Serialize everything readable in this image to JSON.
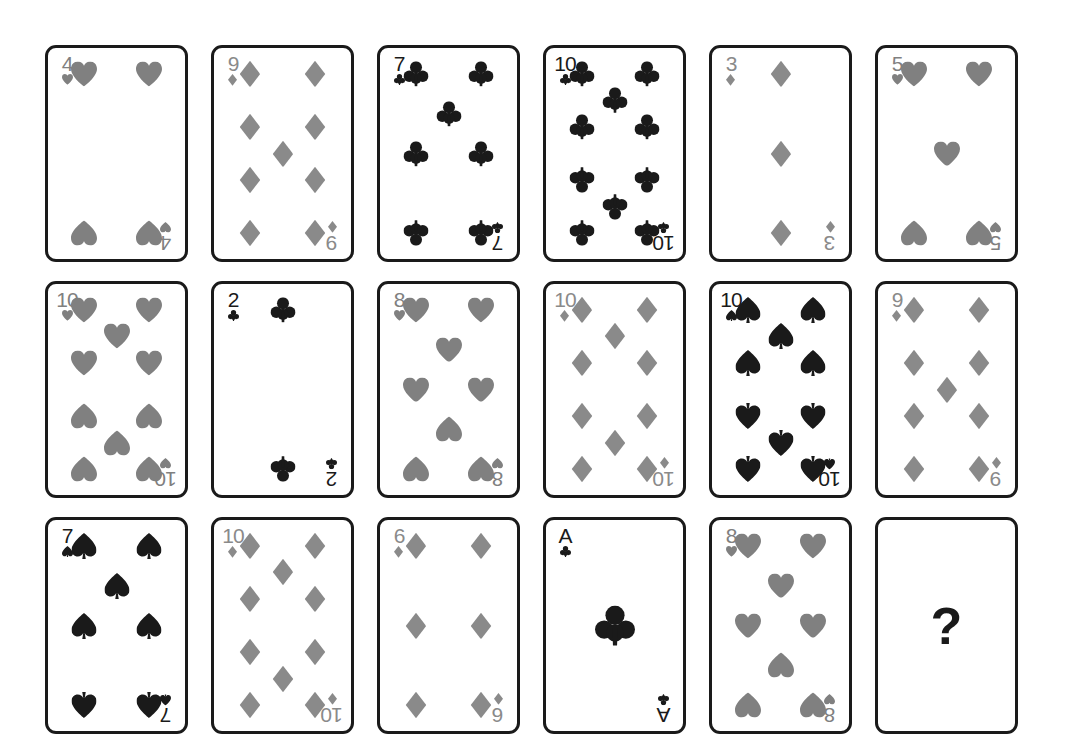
{
  "page": {
    "background_color": "#ffffff",
    "rows": 3,
    "columns": 6
  },
  "colors": {
    "hearts": "#808080",
    "diamonds": "#8a8a8a",
    "clubs": "#1a1a1a",
    "spades": "#1a1a1a",
    "card_border": "#1a1a1a",
    "card_face": "#ffffff",
    "unknown_mark": "#1a1a1a"
  },
  "suit_glyphs": {
    "hearts": "heart-pip",
    "diamonds": "diamond-pip",
    "clubs": "club-pip",
    "spades": "spade-pip"
  },
  "cards": [
    {
      "position": 1,
      "row": 1,
      "col": 1,
      "rank": "4",
      "suit": "hearts",
      "value": 4,
      "face_up": true,
      "label": "4 of Hearts"
    },
    {
      "position": 2,
      "row": 1,
      "col": 2,
      "rank": "9",
      "suit": "diamonds",
      "value": 9,
      "face_up": true,
      "label": "9 of Diamonds"
    },
    {
      "position": 3,
      "row": 1,
      "col": 3,
      "rank": "7",
      "suit": "clubs",
      "value": 7,
      "face_up": true,
      "label": "7 of Clubs"
    },
    {
      "position": 4,
      "row": 1,
      "col": 4,
      "rank": "10",
      "suit": "clubs",
      "value": 10,
      "face_up": true,
      "label": "10 of Clubs"
    },
    {
      "position": 5,
      "row": 1,
      "col": 5,
      "rank": "3",
      "suit": "diamonds",
      "value": 3,
      "face_up": true,
      "label": "3 of Diamonds"
    },
    {
      "position": 6,
      "row": 1,
      "col": 6,
      "rank": "5",
      "suit": "hearts",
      "value": 5,
      "face_up": true,
      "label": "5 of Hearts"
    },
    {
      "position": 7,
      "row": 2,
      "col": 1,
      "rank": "10",
      "suit": "hearts",
      "value": 10,
      "face_up": true,
      "label": "10 of Hearts"
    },
    {
      "position": 8,
      "row": 2,
      "col": 2,
      "rank": "2",
      "suit": "clubs",
      "value": 2,
      "face_up": true,
      "label": "2 of Clubs"
    },
    {
      "position": 9,
      "row": 2,
      "col": 3,
      "rank": "8",
      "suit": "hearts",
      "value": 8,
      "face_up": true,
      "label": "8 of Hearts"
    },
    {
      "position": 10,
      "row": 2,
      "col": 4,
      "rank": "10",
      "suit": "diamonds",
      "value": 10,
      "face_up": true,
      "label": "10 of Diamonds"
    },
    {
      "position": 11,
      "row": 2,
      "col": 5,
      "rank": "10",
      "suit": "spades",
      "value": 10,
      "face_up": true,
      "label": "10 of Spades"
    },
    {
      "position": 12,
      "row": 2,
      "col": 6,
      "rank": "9",
      "suit": "diamonds",
      "value": 9,
      "face_up": true,
      "label": "9 of Diamonds"
    },
    {
      "position": 13,
      "row": 3,
      "col": 1,
      "rank": "7",
      "suit": "spades",
      "value": 7,
      "face_up": true,
      "label": "7 of Spades"
    },
    {
      "position": 14,
      "row": 3,
      "col": 2,
      "rank": "10",
      "suit": "diamonds",
      "value": 10,
      "face_up": true,
      "label": "10 of Diamonds"
    },
    {
      "position": 15,
      "row": 3,
      "col": 3,
      "rank": "6",
      "suit": "diamonds",
      "value": 6,
      "face_up": true,
      "label": "6 of Diamonds"
    },
    {
      "position": 16,
      "row": 3,
      "col": 4,
      "rank": "A",
      "suit": "clubs",
      "value": 1,
      "face_up": true,
      "label": "Ace of Clubs"
    },
    {
      "position": 17,
      "row": 3,
      "col": 5,
      "rank": "8",
      "suit": "hearts",
      "value": 8,
      "face_up": true,
      "label": "8 of Hearts"
    },
    {
      "position": 18,
      "row": 3,
      "col": 6,
      "rank": "?",
      "suit": null,
      "value": null,
      "face_up": false,
      "label": "Unknown card"
    }
  ],
  "unknown_card": {
    "mark": "?"
  }
}
